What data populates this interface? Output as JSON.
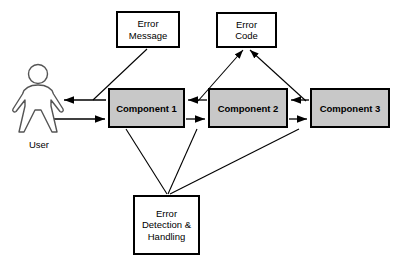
{
  "diagram": {
    "background_color": "#ffffff",
    "line_color": "#000000",
    "node_fill_gray": "#c8c8c8",
    "node_fill_white": "#ffffff",
    "actor": {
      "icon": "user-person-icon",
      "label": "User"
    },
    "nodes": [
      {
        "id": "error_message",
        "label": "Error\nMessage",
        "style": "white",
        "x": 116,
        "y": 11,
        "w": 64,
        "h": 37
      },
      {
        "id": "error_code",
        "label": "Error\nCode",
        "style": "white",
        "x": 216,
        "y": 12,
        "w": 61,
        "h": 36
      },
      {
        "id": "component_1",
        "label": "Component 1",
        "style": "gray",
        "x": 108,
        "y": 88,
        "w": 77,
        "h": 40
      },
      {
        "id": "component_2",
        "label": "Component 2",
        "style": "gray",
        "x": 208,
        "y": 88,
        "w": 80,
        "h": 40
      },
      {
        "id": "component_3",
        "label": "Component 3",
        "style": "gray",
        "x": 310,
        "y": 88,
        "w": 80,
        "h": 40
      },
      {
        "id": "error_detection",
        "label": "Error\nDetection &\nHandling",
        "style": "white",
        "x": 133,
        "y": 195,
        "w": 67,
        "h": 60
      }
    ],
    "edges": [
      {
        "id": "comp1-to-user",
        "from": "component_1",
        "to": "user",
        "kind": "horizontal-arrow",
        "arrowhead": "end",
        "points": "106,100 62,100"
      },
      {
        "id": "user-to-comp1",
        "from": "user",
        "to": "component_1",
        "kind": "horizontal-arrow",
        "arrowhead": "end",
        "points": "48,119 106,119"
      },
      {
        "id": "comp2-to-comp1",
        "from": "component_2",
        "to": "component_1",
        "kind": "horizontal-arrow",
        "arrowhead": "end",
        "points": "207,100 187,100"
      },
      {
        "id": "comp1-to-comp2",
        "from": "component_1",
        "to": "component_2",
        "kind": "horizontal-arrow",
        "arrowhead": "end",
        "points": "186,119 206,119"
      },
      {
        "id": "comp3-to-comp2",
        "from": "component_3",
        "to": "component_2",
        "kind": "horizontal-arrow",
        "arrowhead": "end",
        "points": "309,100 290,100"
      },
      {
        "id": "comp2-to-comp3",
        "from": "component_2",
        "to": "component_3",
        "kind": "horizontal-arrow",
        "arrowhead": "end",
        "points": "289,119 308,119"
      },
      {
        "id": "errormessage-to-user-path",
        "from": "error_message",
        "to": "comp1-to-user",
        "kind": "diagonal",
        "arrowhead": "none",
        "points": "147,49 93,100"
      },
      {
        "id": "comp1-to-errorcode",
        "from": "component_1",
        "to": "error_code",
        "kind": "diagonal-arrow",
        "arrowhead": "start",
        "points": "198,100 243,50"
      },
      {
        "id": "comp3-to-errorcode",
        "from": "component_3",
        "to": "error_code",
        "kind": "diagonal-arrow",
        "arrowhead": "start",
        "points": "305,100 250,50"
      },
      {
        "id": "comp1-to-errordetection",
        "from": "component_1",
        "to": "error_detection",
        "kind": "diagonal",
        "arrowhead": "none",
        "points": "126,129 167,194"
      },
      {
        "id": "comp2-to-errordetection",
        "from": "component_2",
        "to": "error_detection",
        "kind": "diagonal",
        "arrowhead": "none",
        "points": "197,129 168,194"
      },
      {
        "id": "comp3-to-errordetection",
        "from": "component_3",
        "to": "error_detection",
        "kind": "diagonal",
        "arrowhead": "none",
        "points": "299,129 169,194"
      }
    ]
  }
}
